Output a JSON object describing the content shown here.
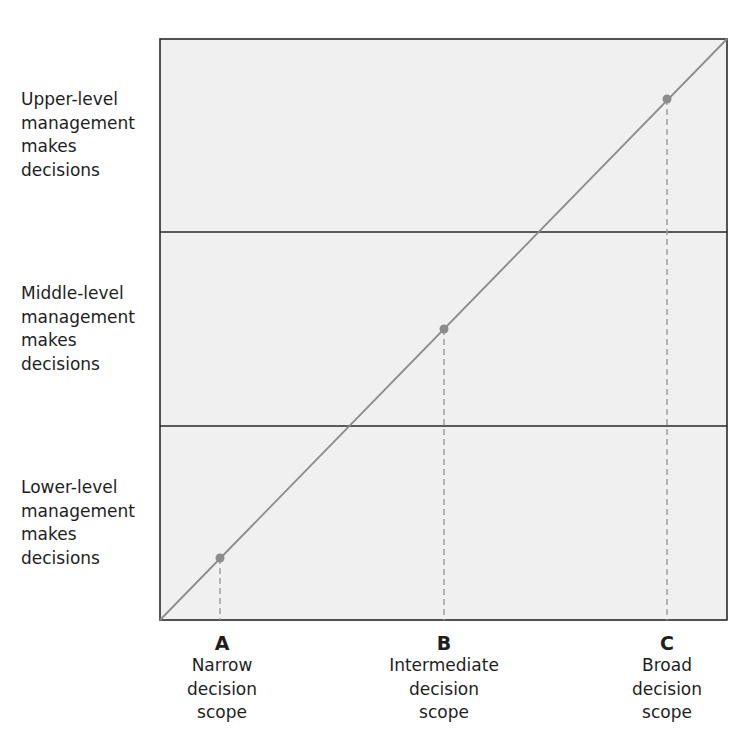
{
  "diagram": {
    "type": "decision-scope-matrix",
    "rows": [
      {
        "id": "upper",
        "lines": [
          "Upper-level",
          "management",
          "makes",
          "decisions"
        ]
      },
      {
        "id": "middle",
        "lines": [
          "Middle-level",
          "management",
          "makes",
          "decisions"
        ]
      },
      {
        "id": "lower",
        "lines": [
          "Lower-level",
          "management",
          "makes",
          "decisions"
        ]
      }
    ],
    "columns": [
      {
        "letter": "A",
        "lines": [
          "Narrow",
          "decision",
          "scope"
        ]
      },
      {
        "letter": "B",
        "lines": [
          "Intermediate",
          "decision",
          "scope"
        ]
      },
      {
        "letter": "C",
        "lines": [
          "Broad",
          "decision",
          "scope"
        ]
      }
    ],
    "colors": {
      "panel_fill": "#f0f0f0",
      "border": "#2a2a2a",
      "diagonal": "#8c8c8c",
      "point": "#8c8c8c",
      "dashed": "#9a9a9a"
    }
  }
}
